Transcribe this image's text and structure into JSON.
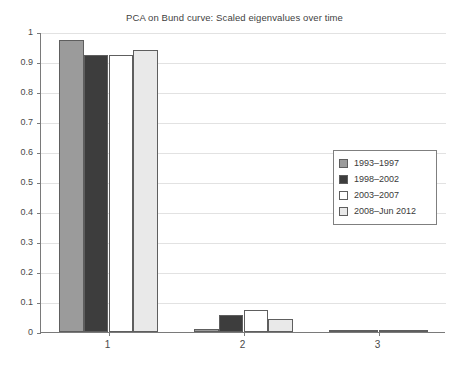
{
  "chart_data": {
    "type": "bar",
    "title": "PCA on Bund curve: Scaled eigenvalues over time",
    "xlabel": "",
    "ylabel": "",
    "categories": [
      "1",
      "2",
      "3"
    ],
    "series": [
      {
        "name": "1993–1997",
        "values": [
          0.975,
          0.01,
          0.004
        ],
        "color": "#9b9b9b"
      },
      {
        "name": "1998–2002",
        "values": [
          0.925,
          0.057,
          0.004
        ],
        "color": "#3d3d3d"
      },
      {
        "name": "2003–2007",
        "values": [
          0.925,
          0.075,
          0.004
        ],
        "color": "#ffffff"
      },
      {
        "name": "2008–Jun 2012",
        "values": [
          0.94,
          0.043,
          0.004
        ],
        "color": "#e9e9e9"
      }
    ],
    "ylim": [
      0,
      1
    ],
    "ytick_labels": [
      "0",
      "0.1",
      "0.2",
      "0.3",
      "0.4",
      "0.5",
      "0.6",
      "0.7",
      "0.8",
      "0.9",
      "1"
    ],
    "ytick_values": [
      0,
      0.1,
      0.2,
      0.3,
      0.4,
      0.5,
      0.6,
      0.7,
      0.8,
      0.9,
      1
    ],
    "grid": true,
    "legend_position": "center-right",
    "bar_edge_color": "#5e5e5e",
    "axis_color": "#7a7a7a",
    "grid_color": "#e2e2e2"
  },
  "legend": {
    "entries": [
      {
        "label": "1993–1997"
      },
      {
        "label": "1998–2002"
      },
      {
        "label": "2003–2007"
      },
      {
        "label": "2008–Jun 2012"
      }
    ]
  }
}
